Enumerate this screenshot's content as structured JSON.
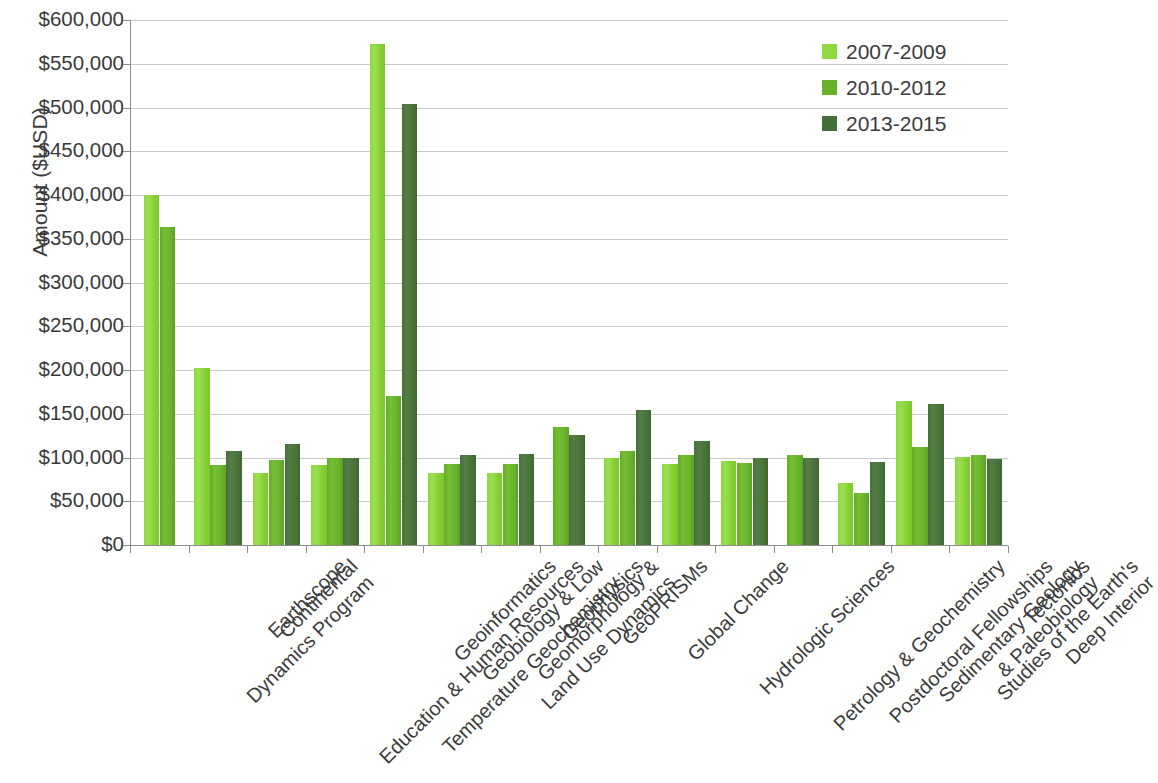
{
  "chart_data": {
    "type": "bar",
    "title": "",
    "xlabel": "",
    "ylabel": "Amount ($USD)",
    "ylim": [
      0,
      600000
    ],
    "ytick_labels": [
      "$600,000",
      "$550,000",
      "$500,000",
      "$450,000",
      "$400,000",
      "$350,000",
      "$300,000",
      "$250,000",
      "$200,000",
      "$150,000",
      "$100,000",
      "$50,000",
      "$0"
    ],
    "ytick_values": [
      600000,
      550000,
      500000,
      450000,
      400000,
      350000,
      300000,
      250000,
      200000,
      150000,
      100000,
      50000,
      0
    ],
    "grid": true,
    "legend_position": "top-right",
    "categories": [
      "Continental Dynamics Program",
      "Earthscope",
      "Education & Human Resources",
      "Geobiology & Low Temperature Geochemistry",
      "Geoinformatics",
      "Geomorphology & Land Use Dynamics",
      "Geophysics",
      "GeoPRISMs",
      "Global Change",
      "Hydrologic Sciences",
      "Petrology & Geochemistry",
      "Postdoctoral Fellowships",
      "Sedimentary Geology & Paleobiology",
      "Studies of the Earth's Deep Interior",
      "Tectonics"
    ],
    "category_lines": [
      [
        "Continental",
        "Dynamics Program"
      ],
      [
        "Earthscope"
      ],
      [
        "Education & Human Resources"
      ],
      [
        "Geobiology & Low",
        "Temperature Geochemistry"
      ],
      [
        "Geoinformatics"
      ],
      [
        "Geomorphology &",
        "Land Use Dynamics"
      ],
      [
        "Geophysics"
      ],
      [
        "GeoPRISMs"
      ],
      [
        "Global Change"
      ],
      [
        "Hydrologic Sciences"
      ],
      [
        "Petrology & Geochemistry"
      ],
      [
        "Postdoctoral Fellowships"
      ],
      [
        "Sedimentary Geology",
        "& Paleobiology"
      ],
      [
        "Studies of the Earth's",
        "Deep Interior"
      ],
      [
        "Tectonics"
      ]
    ],
    "series": [
      {
        "name": "2007-2009",
        "color": "#8fd93f",
        "values": [
          400000,
          202000,
          82000,
          91000,
          573000,
          82000,
          82000,
          null,
          99000,
          93000,
          96000,
          null,
          71000,
          165000,
          101000
        ]
      },
      {
        "name": "2010-2012",
        "color": "#66b02a",
        "values": [
          363000,
          92000,
          97000,
          99000,
          170000,
          93000,
          93000,
          135000,
          107000,
          103000,
          94000,
          103000,
          59000,
          112000,
          103000
        ]
      },
      {
        "name": "2013-2015",
        "color": "#46703a",
        "values": [
          null,
          108000,
          115000,
          99000,
          504000,
          103000,
          104000,
          126000,
          154000,
          119000,
          99000,
          99000,
          95000,
          161000,
          98000
        ]
      }
    ]
  },
  "legend": {
    "items": [
      {
        "label": "2007-2009"
      },
      {
        "label": "2010-2012"
      },
      {
        "label": "2013-2015"
      }
    ]
  },
  "axes": {
    "y_title": "Amount ($USD)"
  }
}
